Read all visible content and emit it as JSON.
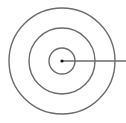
{
  "diagram": {
    "type": "concentric-circles",
    "center": {
      "x": 62,
      "y": 61
    },
    "circles": [
      {
        "name": "outer",
        "r": 53
      },
      {
        "name": "middle",
        "r": 33
      },
      {
        "name": "inner",
        "r": 13
      }
    ],
    "center_dot_r": 1.6,
    "radius_line": {
      "x1": 62,
      "y1": 61,
      "x2": 126,
      "y2": 61
    },
    "stroke_color": "#6b6b6b",
    "dot_color": "#111111",
    "stroke_width": 1.4
  }
}
